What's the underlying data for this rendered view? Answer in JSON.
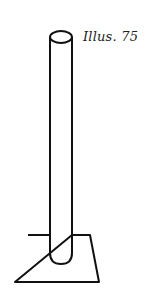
{
  "illustration": {
    "caption": "Illus. 75",
    "subject": "vertical tube standing on a square base plate",
    "stroke_color": "#111111",
    "background": "#ffffff"
  }
}
